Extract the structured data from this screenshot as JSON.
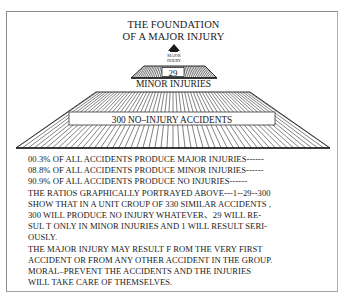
{
  "title": {
    "line1": "THE FOUNDATION",
    "line2": "OF A MAJOR INJURY"
  },
  "pyramid": {
    "apex_label_line1": "MAJOR",
    "apex_label_line2": "INJURY",
    "middle_count": "29",
    "middle_label": "MINOR INJURIES",
    "base_label": "300 NO–INJURY ACCIDENTS",
    "colors": {
      "line": "#1a1a1a",
      "fill": "#ffffff"
    }
  },
  "chart_data": {
    "type": "pyramid",
    "categories": [
      "MAJOR INJURY",
      "MINOR INJURIES",
      "NO-INJURY ACCIDENTS"
    ],
    "values": [
      1,
      29,
      300
    ],
    "percentages": [
      0.3,
      8.8,
      90.9
    ],
    "ratio": "1:29:300"
  },
  "text": {
    "lines": [
      "00.3% OF ALL ACCIDENTS PRODUCE MAJOR INJURIES------",
      "08.8% OF ALL ACCIDENTS PRODUCE MINOR INJURIES------",
      "90.9% OF ALL ACCIDENTS PRODUCE NO INJURIES------",
      "THE RATIOS GRAPHICALLY PORTRAYED ABOVE---1--29--300",
      "SHOW THAT IN A UNIT CROUP OF 330 SIMILAR ACCIDENTS ,",
      "300 WILL PRODUCE NO INJURY WHATEVER、29 WILL RE-",
      "SUL T ONLY IN MINOR INJURIES AND 1 WILL RESULT SERI-",
      "OUSLY.",
      "THE MAJOR INJURY MAY RESULT F ROM THE VERY FIRST",
      "ACCIDENT OR FROM ANY OTHER ACCIDENT IN THE GROUP.",
      "MORAL–PREVENT THE ACCIDENTS AND THE INJURIES",
      "WILL TAKE CARE OF THEMSELVES."
    ]
  }
}
